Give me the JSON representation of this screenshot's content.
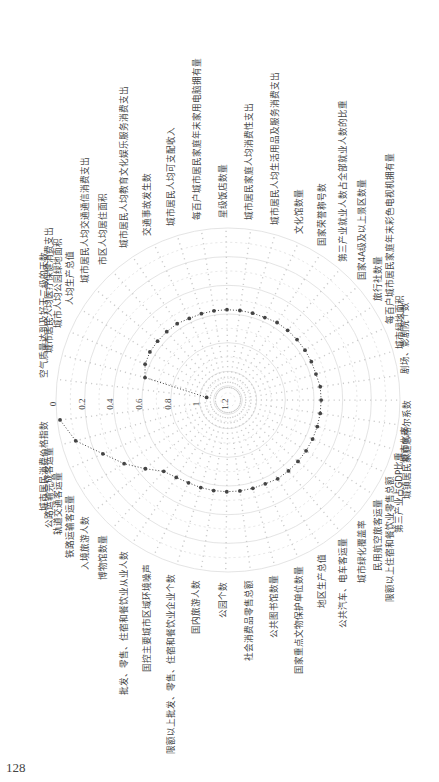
{
  "page": {
    "caption": "",
    "page_number": "128"
  },
  "chart_data": {
    "type": "radar",
    "title": "",
    "orientation_note": "figure rotated 90° counter-clockwise on page; radial axis inverted (0 at outer ring, 1.2 at center)",
    "radial_ticks": [
      "0",
      "0.2",
      "0.4",
      "0.6",
      "0.8",
      "1",
      "1.2"
    ],
    "rlim": [
      1.2,
      0
    ],
    "grid": true,
    "categories": [
      "空气质量达到及好于二级的天数",
      "城市居民人均医疗保健消费支出",
      "城市人均公园绿地面积",
      "人均生产总值",
      "城市居民人均交通通信消费支出",
      "市区人均居住面积",
      "城市居民人均教育文化娱乐服务消费支出",
      "交通事故发生数",
      "城市居民人均可支配收入",
      "每百户城市居民家庭年末家用电脑拥有量",
      "星级饭店数量",
      "城市居民家庭人均消费性支出",
      "城市居民人均生活用品及服务消费支出",
      "文化馆数量",
      "国家荣誉称号数",
      "第三产业就业人数占全部就业人数的比重",
      "国家4A级及以上景区数量",
      "旅行社数量",
      "每百户城市居民家庭年末彩色电视机拥有量",
      "城市绿地面积",
      "剧场、影剧院个数",
      "城镇居民家庭恩格尔系数",
      "城市化率",
      "第三产业占GDP比重",
      "限额以上住宿和餐饮业零售总额",
      "民用航空旅客运量",
      "城市绿化覆盖率",
      "公共汽车、电车客运量",
      "地区生产总值",
      "国家重点文物保护单位数量",
      "公共图书馆数量",
      "社会消费品零售总额",
      "公园个数",
      "国内旅游人数",
      "限额以上批发、零售、住宿和餐饮业企业个数",
      "国控主要城市区域环境噪声",
      "批发、零售、住宿和餐饮业从业人数",
      "博物馆数量",
      "入境旅游人数",
      "铁路运输客运量",
      "轨道交通客运量",
      "公路运输完成客运量",
      "城市居民消费价格指数"
    ],
    "series": [
      {
        "name": "",
        "values": [
          1.05,
          0.6,
          0.57,
          0.56,
          0.56,
          0.56,
          0.56,
          0.57,
          0.57,
          0.57,
          0.57,
          0.57,
          0.57,
          0.57,
          0.56,
          0.56,
          0.56,
          0.56,
          0.56,
          0.56,
          0.55,
          0.55,
          0.55,
          0.55,
          0.55,
          0.55,
          0.55,
          0.55,
          0.55,
          0.56,
          0.56,
          0.56,
          0.56,
          0.56,
          0.56,
          0.56,
          0.55,
          0.53,
          0.45,
          0.35,
          0.25,
          0.1,
          0.02
        ]
      }
    ],
    "line_style": "dotted",
    "marker": "dot",
    "color": "#444444"
  }
}
